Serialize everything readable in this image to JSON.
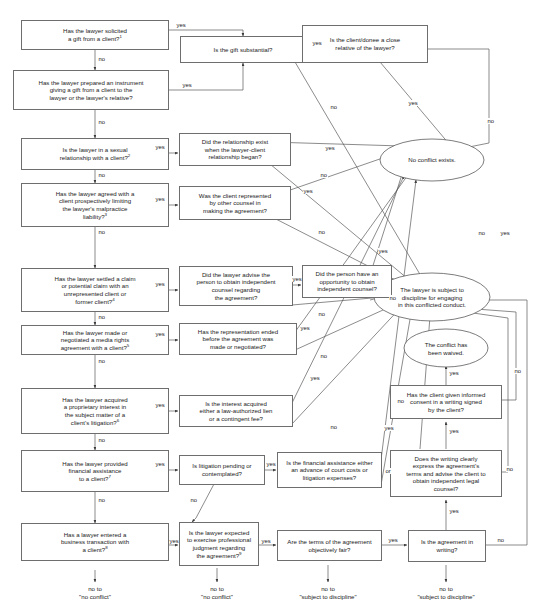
{
  "meta": {
    "edge_yes": "yes",
    "edge_no": "no",
    "edge_or": "or"
  },
  "nodes": {
    "q1": {
      "text": "Has the lawyer solicited\na gift from a client?",
      "note": "1"
    },
    "q2": {
      "text": "Has the lawyer prepared an instrument\ngiving a gift from a client to the\nlawyer or the lawyer's relative?",
      "note": ""
    },
    "q3": {
      "text": "Is the lawyer in a sexual\nrelationship with a client?",
      "note": "2"
    },
    "q4": {
      "text": "Has the lawyer agreed with a\nclient prospectively limiting\nthe lawyer's malpractice\nliability?",
      "note": "3"
    },
    "q5": {
      "text": "Has the lawyer settled a claim\nor potential claim with an\nunrepresented client or\nformer client?",
      "note": "4"
    },
    "q6": {
      "text": "Has the lawyer made or\nnegotiated a media rights\nagreement with a client?",
      "note": "5"
    },
    "q7": {
      "text": "Has the lawyer acquired\na proprietary interest in\nthe subject matter of a\nclient's litigation?",
      "note": "6"
    },
    "q8": {
      "text": "Has the lawyer provided\nfinancial assistance\nto a client?",
      "note": "7"
    },
    "q9": {
      "text": "Has a lawyer entered a\nbusiness transaction with\na client?",
      "note": "8"
    },
    "q10": {
      "text": "Is the gift substantial?",
      "note": ""
    },
    "q11": {
      "text": "Is the client/donee a close\nrelative of the lawyer?",
      "note": ""
    },
    "q12": {
      "text": "Did the relationship exist\nwhen the lawyer-client\nrelationship began?",
      "note": ""
    },
    "q13": {
      "text": "Was the client represented\nby other counsel in\nmaking the agreement?",
      "note": ""
    },
    "q14": {
      "text": "Did the lawyer advise the\nperson to obtain independent\ncounsel regarding\nthe agreement?",
      "note": ""
    },
    "q15": {
      "text": "Did the person have an\nopportunity to obtain\nindependent counsel?",
      "note": ""
    },
    "q16": {
      "text": "Has the representation ended\nbefore the agreement was\nmade or negotiated?",
      "note": ""
    },
    "q17": {
      "text": "Is the interest acquired\neither a law-authorized lien\nor a contingent fee?",
      "note": ""
    },
    "q18": {
      "text": "Is litigation pending or\ncontemplated?",
      "note": ""
    },
    "q19": {
      "text": "Is the financial assistance either\nan advance of court costs or\nlitigation expenses?",
      "note": ""
    },
    "q20": {
      "text": "Is the lawyer expected\nto exercise professional\njudgment regarding\nthe agreement?",
      "note": "9"
    },
    "q21": {
      "text": "Are the terms of the agreement\nobjectively fair?",
      "note": ""
    },
    "q22": {
      "text": "Is the agreement in\nwriting?",
      "note": ""
    },
    "q23": {
      "text": "Has the client given informed\nconsent in a writing signed\nby the client?",
      "note": ""
    },
    "q24": {
      "text": "Does the writing clearly\nexpress the agreement's\nterms and advise the client to\nobtain independent legal\ncounsel?",
      "note": ""
    }
  },
  "outcomes": {
    "no_conflict": "No conflict exists.",
    "discipline": "The lawyer is subject to\ndiscipline for engaging\nin this conflicted conduct.",
    "waived": "The conflict has\nbeen waived."
  },
  "terminals": {
    "t1": "no to\n\"no conflict\"",
    "t2": "no to\n\"no conflict\"",
    "t3": "no to\n\"subject to discipline\"",
    "t4": "no to\n\"subject to discipline\""
  },
  "colors": {
    "box_border": "#6e6e6e",
    "edge": "#4a4a4a",
    "text": "#1a1a1a",
    "background": "#ffffff"
  }
}
